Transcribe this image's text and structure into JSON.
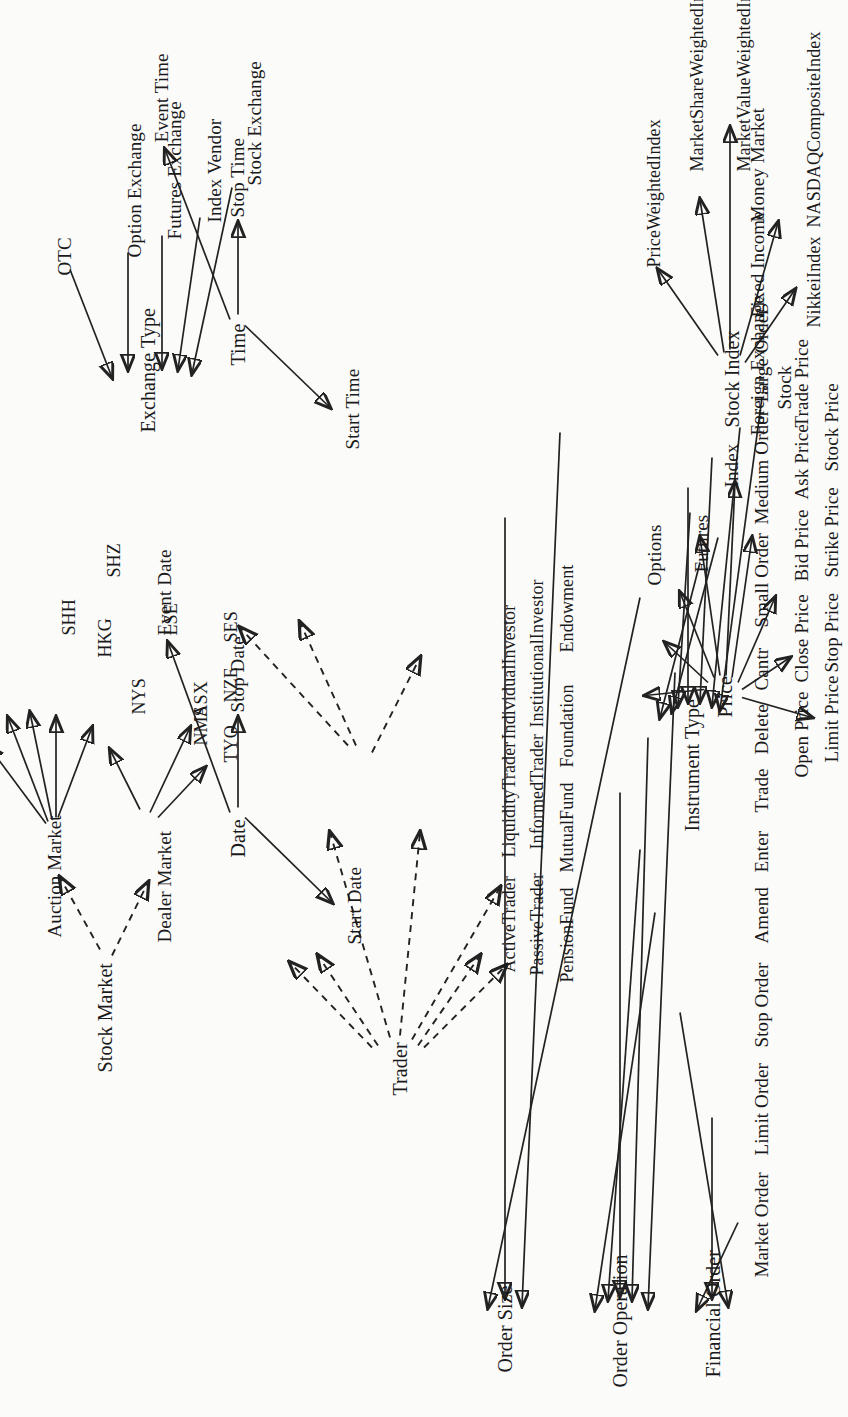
{
  "figure": {
    "type": "taxonomy-diagram",
    "orientation": "rotated-90-ccw",
    "solid_edge_meaning": "is-a (subclass of)",
    "dashed_edge_meaning": "is-a (dashed variant)"
  },
  "groups": {
    "financial_order": {
      "parent": "Financial Order",
      "children": [
        "Market Order",
        "Limit Order",
        "Stop Order"
      ]
    },
    "order_operation": {
      "parent": "Order Operation",
      "children": [
        "Amend",
        "Enter",
        "Trade",
        "Delete",
        "Cantr"
      ]
    },
    "order_size": {
      "parent": "Order Size",
      "children": [
        "Small Order",
        "Medium Order",
        "Large Order"
      ]
    },
    "price": {
      "parent": "Price",
      "children": [
        "Limit Price",
        "Open Price",
        "Close Price",
        "Stop Price",
        "Bid Price",
        "Strike Price",
        "Ask Price",
        "Stock Price",
        "Trade Price"
      ]
    },
    "date": {
      "parent": "Date",
      "children": [
        "Start Date",
        "Stop Date",
        "Event Date"
      ]
    },
    "time": {
      "parent": "Time",
      "children": [
        "Start Time",
        "Stop Time",
        "Event Time"
      ]
    },
    "trader": {
      "parent": "Trader",
      "children": [
        "ActiveTrader",
        "PassiveTrader",
        "LiquidityTrader",
        "InformedTrader",
        "IndividualInvestor",
        "InstitutionalInvestor",
        "PensionFund",
        "MutualFund",
        "Foundation",
        "Endowment"
      ]
    },
    "instrument_type": {
      "parent": "Instrument Type",
      "children": [
        "Stock",
        "Index",
        "Futures",
        "Options",
        "Foreign Exchange",
        "Fixed Income",
        "Money Market"
      ]
    },
    "stock_index": {
      "parent": "Stock Index",
      "children": [
        "NikkeiIndex",
        "NASDAQCompositeIndex",
        "PriceWeightedIndex",
        "MarketShareWeightedIndex",
        "MarketValueWeightedIndex"
      ]
    },
    "stock_market": {
      "parent": "Stock Market",
      "children": [
        "Dealer Market",
        "Auction Market"
      ]
    },
    "dealer_market": {
      "parent": "Dealer Market",
      "children": [
        "NMS",
        "TYO"
      ]
    },
    "auction_market": {
      "parent": "Auction Market",
      "children": [
        "ASX",
        "NZE",
        "SES",
        "LSE",
        "NYS",
        "HKG",
        "SHH",
        "SHZ"
      ]
    },
    "exchange_type": {
      "parent": "Exchange Type",
      "children": [
        "Stock Exchange",
        "Index Vendor",
        "Futures Exchange",
        "Option Exchange",
        "OTC"
      ]
    }
  }
}
